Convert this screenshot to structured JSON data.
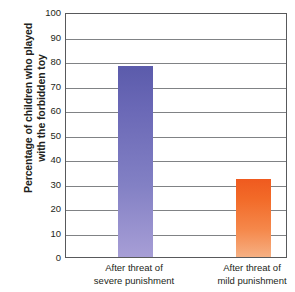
{
  "chart_data": {
    "type": "bar",
    "title": "",
    "subtitle": "",
    "xlabel": "",
    "ylabel": "Percentage of children who played with the forbidden toy",
    "ylabel_lines": [
      "Percentage of children who played",
      "with the forbidden toy"
    ],
    "categories": [
      "After threat of severe punishment",
      "After threat of mild punishment"
    ],
    "category_lines": [
      [
        "After threat of",
        "severe punishment"
      ],
      [
        "After threat of",
        "mild punishment"
      ]
    ],
    "values": [
      78,
      32
    ],
    "ylim": [
      0,
      100
    ],
    "ytick_labels": [
      "0",
      "10",
      "20",
      "30",
      "40",
      "50",
      "60",
      "70",
      "80",
      "90",
      "100"
    ],
    "ytick_values": [
      0,
      10,
      20,
      30,
      40,
      50,
      60,
      70,
      80,
      90,
      100
    ],
    "grid": true,
    "legend": false,
    "legend_position": "none",
    "bar_colors": [
      "#6a68b6",
      "#f26a28"
    ],
    "axis_color": "#58595b",
    "grid_color": "#808285",
    "text_color": "#231f20"
  }
}
